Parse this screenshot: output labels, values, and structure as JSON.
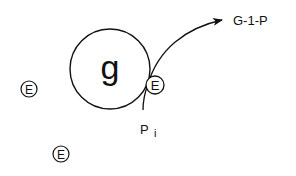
{
  "diagram": {
    "main_node": {
      "label": "g",
      "cx": 110,
      "cy": 69,
      "r": 40
    },
    "enzyme_nodes": [
      {
        "label": "E",
        "cx": 155,
        "cy": 85,
        "r": 9,
        "role": "bound-enzyme"
      },
      {
        "label": "E",
        "cx": 29,
        "cy": 89,
        "r": 8,
        "role": "free-enzyme"
      },
      {
        "label": "E",
        "cx": 61,
        "cy": 154,
        "r": 8,
        "role": "free-enzyme"
      }
    ],
    "arrow": {
      "target_label": "G-1-P",
      "start": [
        143,
        110
      ],
      "end": [
        222,
        20
      ]
    },
    "phosphate_label": {
      "base": "P",
      "subscript": "i"
    },
    "colors": {
      "stroke": "#111111",
      "background": "#ffffff"
    }
  }
}
